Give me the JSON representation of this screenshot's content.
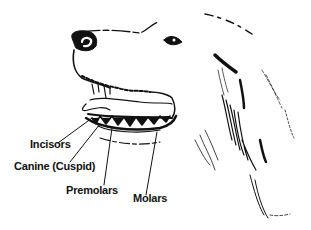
{
  "figure": {
    "labels": [
      {
        "id": "incisors",
        "text": "Incisors"
      },
      {
        "id": "canine",
        "text": "Canine (Cuspid)"
      },
      {
        "id": "premolars",
        "text": "Premolars"
      },
      {
        "id": "molars",
        "text": "Molars"
      }
    ]
  }
}
